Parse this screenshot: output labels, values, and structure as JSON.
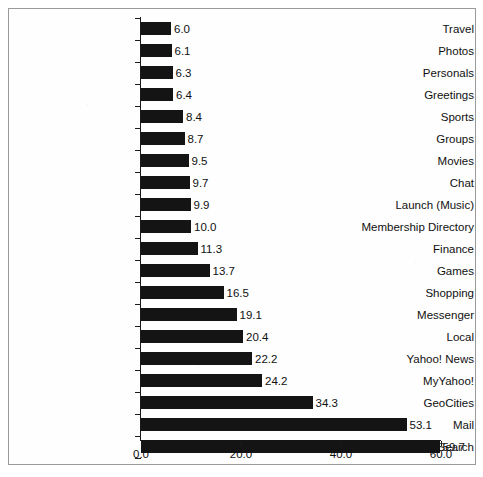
{
  "chart_data": {
    "type": "bar",
    "orientation": "horizontal",
    "title": "",
    "subtitle": "",
    "xlabel": "",
    "ylabel": "",
    "xlim": [
      0.0,
      60.0
    ],
    "xticks": [
      "0.0",
      "20.0",
      "40.0",
      "60.0"
    ],
    "xtick_values": [
      0.0,
      20.0,
      40.0,
      60.0
    ],
    "grid": false,
    "legend": null,
    "bar_color": "#141414",
    "background_color": "#ffffff",
    "show_data_labels": true,
    "categories": [
      "Travel",
      "Photos",
      "Personals",
      "Greetings",
      "Sports",
      "Groups",
      "Movies",
      "Chat",
      "Launch (Music)",
      "Membership Directory",
      "Finance",
      "Games",
      "Shopping",
      "Messenger",
      "Local",
      "Yahoo! News",
      "MyYahoo!",
      "GeoCities",
      "Mail",
      "Search"
    ],
    "values": [
      6.0,
      6.1,
      6.3,
      6.4,
      8.4,
      8.7,
      9.5,
      9.7,
      9.9,
      10.0,
      11.3,
      13.7,
      16.5,
      19.1,
      20.4,
      22.2,
      24.2,
      34.3,
      53.1,
      59.7
    ],
    "value_labels": [
      "6.0",
      "6.1",
      "6.3",
      "6.4",
      "8.4",
      "8.7",
      "9.5",
      "9.7",
      "9.9",
      "10.0",
      "11.3",
      "13.7",
      "16.5",
      "19.1",
      "20.4",
      "22.2",
      "24.2",
      "34.3",
      "53.1",
      "59.7"
    ]
  }
}
